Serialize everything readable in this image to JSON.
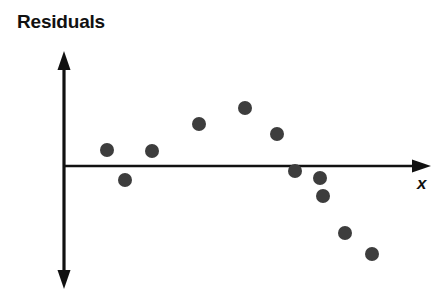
{
  "chart_data": {
    "type": "scatter",
    "title": "Residuals",
    "xlabel": "x",
    "ylabel": "",
    "axis_style": "double-headed-vertical-arrow, right-arrow-horizontal",
    "grid": false,
    "legend": null,
    "axis_color": "#111111",
    "point_color": "#3d3d3d",
    "point_radius_px": 7,
    "origin_px": {
      "x": 64,
      "y": 166
    },
    "y_axis_px": {
      "top": 53,
      "bottom": 287
    },
    "x_axis_px": {
      "left": 64,
      "right": 430
    },
    "annotations": [],
    "points": [
      {
        "px": 107,
        "py": 150,
        "x": 1,
        "y": 0.9
      },
      {
        "px": 125,
        "py": 180,
        "x": 2,
        "y": -0.45
      },
      {
        "px": 152,
        "py": 151,
        "x": 3,
        "y": 0.85
      },
      {
        "px": 199,
        "py": 124,
        "x": 4,
        "y": 2.0
      },
      {
        "px": 245,
        "py": 108,
        "x": 5,
        "y": 2.7
      },
      {
        "px": 277,
        "py": 134,
        "x": 6,
        "y": 1.55
      },
      {
        "px": 295,
        "py": 171,
        "x": 7,
        "y": -0.2
      },
      {
        "px": 320,
        "py": 178,
        "x": 8,
        "y": -0.55
      },
      {
        "px": 323,
        "py": 196,
        "x": 9,
        "y": -1.35
      },
      {
        "px": 345,
        "py": 233,
        "x": 10,
        "y": -3.0
      },
      {
        "px": 372,
        "py": 254,
        "x": 11,
        "y": -3.9
      }
    ]
  }
}
